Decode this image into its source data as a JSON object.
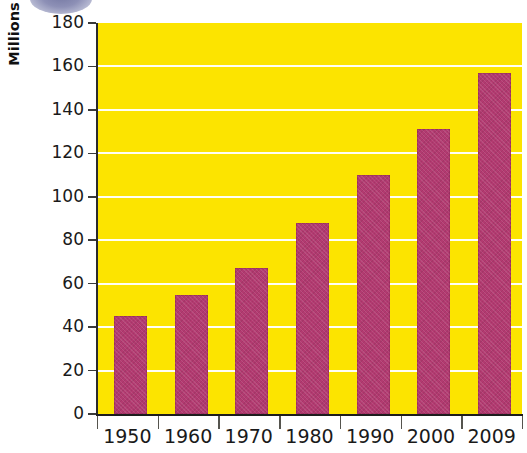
{
  "chart_data": {
    "type": "bar",
    "title": "",
    "xlabel": "",
    "ylabel": "Millions",
    "categories": [
      "1950",
      "1960",
      "1970",
      "1980",
      "1990",
      "2000",
      "2009"
    ],
    "values": [
      45,
      55,
      67,
      88,
      110,
      131,
      157
    ],
    "ylim": [
      0,
      180
    ],
    "ytick_labels": [
      "180",
      "160",
      "140",
      "120",
      "100",
      "80",
      "60",
      "40",
      "20",
      "0"
    ],
    "ytick_values": [
      180,
      160,
      140,
      120,
      100,
      80,
      60,
      40,
      20,
      0
    ],
    "grid": true,
    "legend": "none",
    "colors": {
      "bar": "#b23a70",
      "plot_background": "#fce400",
      "gridline": "#ffffff",
      "axis": "#1d1d1d",
      "text": "#1a1a1a",
      "ellipse": "#878ab2"
    }
  }
}
